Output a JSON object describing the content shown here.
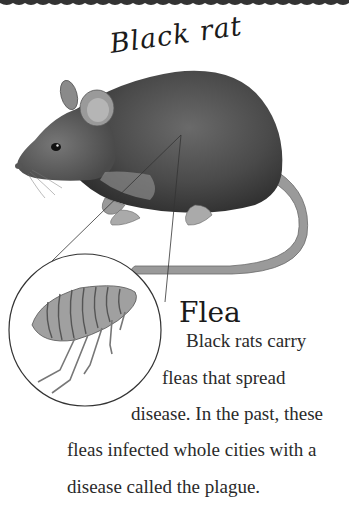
{
  "page": {
    "title": "Black rat",
    "inset_title": "Flea",
    "body_lines": [
      "Black rats carry",
      "fleas that spread",
      "disease. In the past, these",
      "fleas infected whole cities with a",
      "disease called the plague."
    ],
    "illustrations": {
      "main": "black-rat-illustration",
      "inset": "flea-illustration-in-circle"
    }
  }
}
